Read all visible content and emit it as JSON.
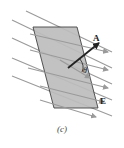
{
  "figure": {
    "caption": "(c)",
    "labels": {
      "area_vector": "A",
      "angle": "θ",
      "field": "E"
    },
    "colors": {
      "surface_fill": "#bdbdbd",
      "surface_stroke": "#333333",
      "field_line": "#9a9a9a",
      "vector": "#222222",
      "text": "#222222"
    }
  }
}
